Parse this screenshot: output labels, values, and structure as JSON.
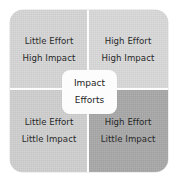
{
  "diagram": {
    "name": "impact-effort-matrix",
    "center_label": {
      "line1": "Impact",
      "line2": "Efforts"
    },
    "quadrants": [
      {
        "position": "top-left",
        "line1": "Little Effort",
        "line2": "High Impact",
        "fill": "#d6d6d6"
      },
      {
        "position": "top-right",
        "line1": "High Effort",
        "line2": "High Impact",
        "fill": "#d9d9d9"
      },
      {
        "position": "bottom-left",
        "line1": "Little Effort",
        "line2": "Little Impact",
        "fill": "#d0d0d0"
      },
      {
        "position": "bottom-right",
        "line1": "High Effort",
        "line2": "Little Impact",
        "fill": "#a9a9a9"
      }
    ],
    "colors": {
      "divider": "#fdfdfd",
      "center_box": "#fcfcfc",
      "text": "#1d1d1d",
      "page_background": "#ffffff"
    }
  }
}
